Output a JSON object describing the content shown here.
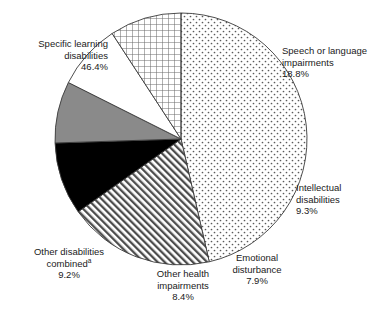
{
  "chart_data": {
    "type": "pie",
    "title": "",
    "subtitle": "",
    "xlabel": "",
    "ylabel": "",
    "legend_position": "none",
    "grid": false,
    "start_angle_deg": 0,
    "direction": "clockwise",
    "categories": [
      "Specific learning disabilities",
      "Speech or language impairments",
      "Intellectual disabilities",
      "Emotional disturbance",
      "Other health impairments",
      "Other disabilities combined"
    ],
    "values": [
      46.4,
      18.8,
      9.3,
      7.9,
      8.4,
      9.2
    ],
    "value_labels": [
      "46.4%",
      "18.8%",
      "9.3%",
      "7.9%",
      "8.4%",
      "9.2%"
    ],
    "units": "percent",
    "slices": [
      {
        "name": "specific-learning-disabilities",
        "label_lines": [
          "Specific learning",
          "disabilities"
        ],
        "value": 46.4,
        "value_label": "46.4%",
        "fill_pattern": "dots",
        "fill_color": "#ffffff",
        "pattern_color": "#595959",
        "start_deg": 0.0,
        "end_deg": 167.04,
        "note": ""
      },
      {
        "name": "speech-or-language-impairments",
        "label_lines": [
          "Speech or language",
          "impairments"
        ],
        "value": 18.8,
        "value_label": "18.8%",
        "fill_pattern": "diagonal-hatch",
        "fill_color": "#ffffff",
        "pattern_color": "#4d4d4d",
        "start_deg": 167.04,
        "end_deg": 234.72,
        "note": ""
      },
      {
        "name": "intellectual-disabilities",
        "label_lines": [
          "Intellectual",
          "disabilities"
        ],
        "value": 9.3,
        "value_label": "9.3%",
        "fill_pattern": "solid",
        "fill_color": "#000000",
        "pattern_color": "#000000",
        "start_deg": 234.72,
        "end_deg": 268.2,
        "note": ""
      },
      {
        "name": "emotional-disturbance",
        "label_lines": [
          "Emotional",
          "disturbance"
        ],
        "value": 7.9,
        "value_label": "7.9%",
        "fill_pattern": "solid",
        "fill_color": "#8a8a8a",
        "pattern_color": "#8a8a8a",
        "start_deg": 268.2,
        "end_deg": 296.64,
        "note": ""
      },
      {
        "name": "other-health-impairments",
        "label_lines": [
          "Other health",
          "impairments"
        ],
        "value": 8.4,
        "value_label": "8.4%",
        "fill_pattern": "none",
        "fill_color": "#ffffff",
        "pattern_color": "#ffffff",
        "start_deg": 296.64,
        "end_deg": 326.88,
        "note": ""
      },
      {
        "name": "other-disabilities-combined",
        "label_lines": [
          "Other disabilities",
          "combined"
        ],
        "value": 9.2,
        "value_label": "9.2%",
        "fill_pattern": "crosshatch-grid",
        "fill_color": "#ffffff",
        "pattern_color": "#6b6b6b",
        "start_deg": 326.88,
        "end_deg": 360.0,
        "note": "a"
      }
    ],
    "geometry": {
      "center_x": 181,
      "center_y": 139,
      "radius": 126
    },
    "colors": {
      "outline": "#3a3a3a",
      "text": "#1a1a1a",
      "background": "#ffffff"
    }
  },
  "labels": {
    "specific_learning_disabilities": {
      "line1": "Specific learning",
      "line2": "disabilities",
      "value": "46.4%"
    },
    "speech_or_language_impairments": {
      "line1": "Speech or language",
      "line2": "impairments",
      "value": "18.8%"
    },
    "intellectual_disabilities": {
      "line1": "Intellectual",
      "line2": "disabilities",
      "value": "9.3%"
    },
    "emotional_disturbance": {
      "line1": "Emotional",
      "line2": "disturbance",
      "value": "7.9%"
    },
    "other_health_impairments": {
      "line1": "Other health",
      "line2": "impairments",
      "value": "8.4%"
    },
    "other_disabilities_combined": {
      "line1": "Other disabilities",
      "line2": "combined",
      "note": "a",
      "value": "9.2%"
    }
  }
}
